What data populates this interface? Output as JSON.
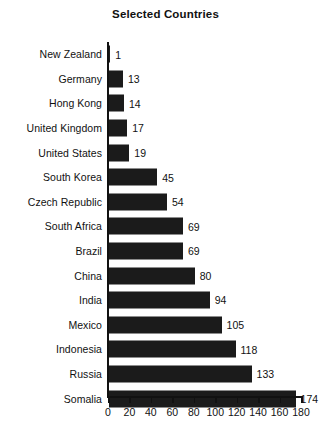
{
  "chart_data": {
    "type": "bar",
    "orientation": "horizontal",
    "title": "Selected Countries",
    "xlabel": "",
    "ylabel": "",
    "xlim": [
      0,
      180
    ],
    "xticks": [
      0,
      20,
      40,
      60,
      80,
      100,
      120,
      140,
      160,
      180
    ],
    "grid": false,
    "legend": null,
    "bar_color": "#1b1b1b",
    "background_color": "#ffffff",
    "show_value_labels": true,
    "categories": [
      "New Zealand",
      "Germany",
      "Hong Kong",
      "United Kingdom",
      "United States",
      "South Korea",
      "Czech Republic",
      "South Africa",
      "Brazil",
      "China",
      "India",
      "Mexico",
      "Indonesia",
      "Russia",
      "Somalia"
    ],
    "values": [
      1,
      13,
      14,
      17,
      19,
      45,
      54,
      69,
      69,
      80,
      94,
      105,
      118,
      133,
      174
    ]
  }
}
